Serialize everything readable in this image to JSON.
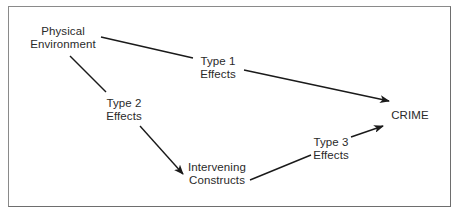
{
  "diagram": {
    "nodes": [
      {
        "id": "physical-environment",
        "lines": [
          "Physical",
          "Environment"
        ]
      },
      {
        "id": "crime",
        "lines": [
          "CRIME"
        ]
      },
      {
        "id": "intervening-constructs",
        "lines": [
          "Intervening",
          "Constructs"
        ]
      }
    ],
    "edges": [
      {
        "id": "type1",
        "from": "physical-environment",
        "to": "crime",
        "lines": [
          "Type 1",
          "Effects"
        ]
      },
      {
        "id": "type2",
        "from": "physical-environment",
        "to": "intervening-constructs",
        "lines": [
          "Type 2",
          "Effects"
        ]
      },
      {
        "id": "type3",
        "from": "intervening-constructs",
        "to": "crime",
        "lines": [
          "Type 3",
          "Effects"
        ]
      }
    ],
    "colors": {
      "line": "#1a1a1a",
      "text": "#2a2a2a",
      "border": "#6e6e6e"
    }
  }
}
